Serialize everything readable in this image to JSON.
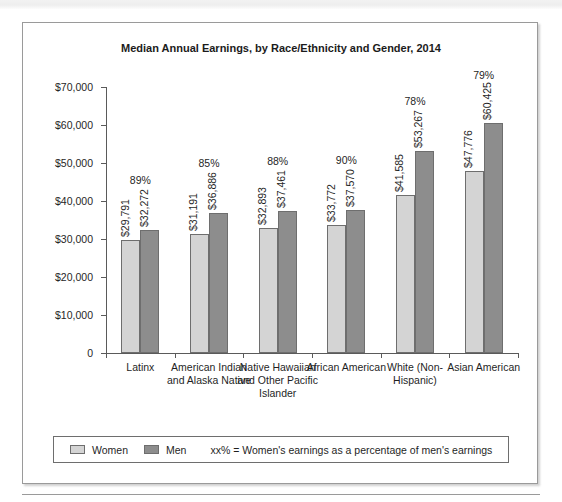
{
  "page": {
    "top_caption_fragment": "",
    "bottom_rule": "horizontal-rule"
  },
  "legend": {
    "women_label": "Women",
    "men_label": "Men",
    "note": "xx% = Women's earnings as a percentage of men's earnings"
  },
  "colors": {
    "women_bar": "#d4d4d4",
    "men_bar": "#8d8d8d",
    "bar_border": "#6e6e6e",
    "axis": "#5a5a5a",
    "frame": "#9a9a9a",
    "text": "#1f1f1f"
  },
  "chart_data": {
    "type": "bar",
    "title": "Median Annual Earnings, by Race/Ethnicity and Gender, 2014",
    "xlabel": "",
    "ylabel": "",
    "ylim": [
      0,
      70000
    ],
    "grid": false,
    "legend_position": "bottom",
    "ytick_labels": [
      "$70,000",
      "$60,000",
      "$50,000",
      "$40,000",
      "$30,000",
      "$20,000",
      "$10,000",
      "0"
    ],
    "ytick_values": [
      70000,
      60000,
      50000,
      40000,
      30000,
      20000,
      10000,
      0
    ],
    "categories": [
      "Latinx",
      "American Indian and Alaska Native",
      "Native Hawaiian and Other Pacific Islander",
      "African American",
      "White (Non-Hispanic)",
      "Asian American"
    ],
    "series": [
      {
        "name": "Women",
        "values": [
          29791,
          31191,
          32893,
          33772,
          41585,
          47776
        ],
        "value_labels": [
          "$29,791",
          "$31,191",
          "$32,893",
          "$33,772",
          "$41,585",
          "$47,776"
        ]
      },
      {
        "name": "Men",
        "values": [
          32272,
          36886,
          37461,
          37570,
          53267,
          60425
        ],
        "value_labels": [
          "$32,272",
          "$36,886",
          "$37,461",
          "$37,570",
          "$53,267",
          "$60,425"
        ]
      }
    ],
    "annotations": {
      "ratio_labels": [
        "89%",
        "85%",
        "88%",
        "90%",
        "78%",
        "79%"
      ],
      "ratio_description": "Women's earnings as a percentage of men's earnings"
    }
  }
}
